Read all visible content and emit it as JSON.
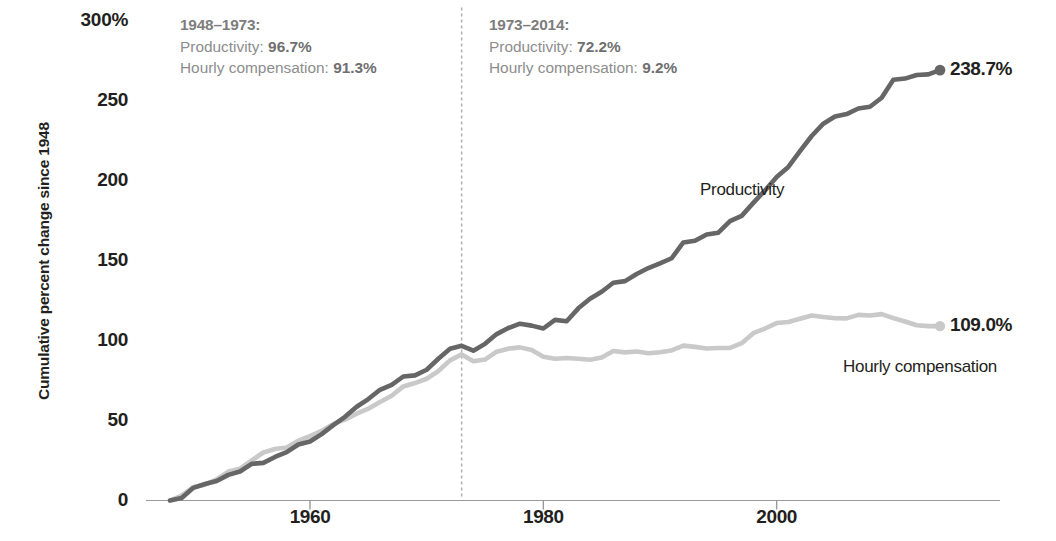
{
  "axes": {
    "y_axis_title": "Cumulative percent change since 1948",
    "y_ticks": [
      "300%",
      "250",
      "200",
      "150",
      "100",
      "50",
      "0"
    ],
    "y_tick_values": [
      300,
      250,
      200,
      150,
      100,
      50,
      0
    ],
    "x_ticks": [
      "1960",
      "1980",
      "2000"
    ],
    "x_tick_values": [
      1960,
      1980,
      2000
    ]
  },
  "annotations": {
    "left": {
      "heading": "1948–1973:",
      "line1_label": "Productivity: ",
      "line1_value": "96.7%",
      "line2_label": "Hourly compensation: ",
      "line2_value": "91.3%"
    },
    "right": {
      "heading": "1973–2014:",
      "line1_label": "Productivity: ",
      "line1_value": "72.2%",
      "line2_label": "Hourly compensation: ",
      "line2_value": "9.2%"
    },
    "divider_year": 1973
  },
  "series_labels": {
    "productivity": "Productivity",
    "compensation": "Hourly compensation"
  },
  "end_labels": {
    "productivity": "238.7%",
    "compensation": "109.0%"
  },
  "colors": {
    "productivity": "#666666",
    "compensation": "#c9c9c9",
    "axis": "#9a9a9a",
    "divider": "#b5b5b5",
    "text": "#231f20",
    "annotation_text": "#8d8d8d"
  },
  "chart_data": {
    "type": "line",
    "title": "",
    "xlabel": "",
    "ylabel": "Cumulative percent change since 1948",
    "xlim": [
      1948,
      2014
    ],
    "ylim": [
      0,
      300
    ],
    "grid": false,
    "legend": "inline-labels",
    "x": [
      1948,
      1949,
      1950,
      1951,
      1952,
      1953,
      1954,
      1955,
      1956,
      1957,
      1958,
      1959,
      1960,
      1961,
      1962,
      1963,
      1964,
      1965,
      1966,
      1967,
      1968,
      1969,
      1970,
      1971,
      1972,
      1973,
      1974,
      1975,
      1976,
      1977,
      1978,
      1979,
      1980,
      1981,
      1982,
      1983,
      1984,
      1985,
      1986,
      1987,
      1988,
      1989,
      1990,
      1991,
      1992,
      1993,
      1994,
      1995,
      1996,
      1997,
      1998,
      1999,
      2000,
      2001,
      2002,
      2003,
      2004,
      2005,
      2006,
      2007,
      2008,
      2009,
      2010,
      2011,
      2012,
      2013,
      2014
    ],
    "series": [
      {
        "name": "Productivity",
        "color": "#666666",
        "values": [
          0,
          1.6,
          7.9,
          10.3,
          12.2,
          16.0,
          18.1,
          22.9,
          23.5,
          27.2,
          30.2,
          35.0,
          36.9,
          41.5,
          47.1,
          52.3,
          58.6,
          63.4,
          69.2,
          72.3,
          77.5,
          78.2,
          81.7,
          88.6,
          94.8,
          96.7,
          93.6,
          97.9,
          104.0,
          107.8,
          110.5,
          109.3,
          107.5,
          112.9,
          112.0,
          120.1,
          126.1,
          130.5,
          136.1,
          137.1,
          141.6,
          145.3,
          148.2,
          151.4,
          161.3,
          162.4,
          166.3,
          167.4,
          174.6,
          177.9,
          186.0,
          193.8,
          202.2,
          208.5,
          218.3,
          227.8,
          235.5,
          240.0,
          241.5,
          245.0,
          246.1,
          251.7,
          263.0,
          263.7,
          265.9,
          266.3,
          269.0
        ],
        "endpoint_value": 238.7
      },
      {
        "name": "Hourly compensation",
        "color": "#c9c9c9",
        "values": [
          0,
          3.1,
          8.4,
          9.9,
          13.2,
          18.1,
          19.9,
          25.0,
          30.0,
          32.2,
          33.1,
          37.4,
          40.3,
          43.5,
          47.9,
          50.5,
          54.3,
          57.4,
          61.6,
          65.5,
          71.3,
          73.4,
          76.1,
          80.9,
          87.6,
          91.3,
          87.0,
          88.1,
          93.0,
          94.9,
          95.7,
          94.0,
          89.9,
          88.6,
          89.1,
          88.6,
          88.0,
          89.4,
          93.4,
          92.6,
          93.1,
          92.0,
          92.7,
          93.8,
          96.8,
          96.0,
          95.0,
          95.3,
          95.4,
          98.3,
          104.6,
          107.5,
          110.9,
          111.6,
          113.6,
          115.6,
          114.7,
          113.9,
          113.8,
          116.0,
          115.6,
          116.5,
          114.0,
          111.9,
          109.5,
          109.0,
          109.0
        ],
        "endpoint_value": 109.0
      }
    ],
    "notes": {
      "productivity_1948_1973_growth": "96.7%",
      "compensation_1948_1973_growth": "91.3%",
      "productivity_1973_2014_growth": "72.2%",
      "compensation_1973_2014_growth": "9.2%"
    }
  }
}
